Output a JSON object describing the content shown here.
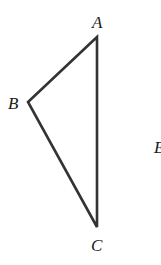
{
  "diagram": {
    "type": "triangle",
    "vertices": {
      "A": {
        "label": "A",
        "x": 97,
        "y": 37
      },
      "B": {
        "label": "B",
        "x": 28,
        "y": 102
      },
      "C": {
        "label": "C",
        "x": 97,
        "y": 227
      }
    },
    "extra_labels": [
      {
        "label": "E",
        "partial": true
      }
    ],
    "stroke_color": "#333333"
  }
}
